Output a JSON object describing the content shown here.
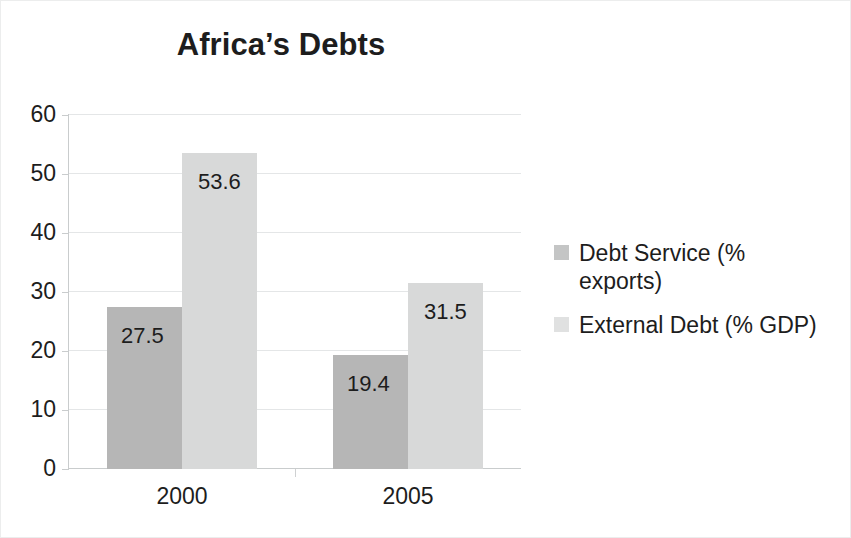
{
  "chart_data": {
    "type": "bar",
    "title": "Africa’s Debts",
    "xlabel": "",
    "ylabel": "",
    "categories": [
      "2000",
      "2005"
    ],
    "series": [
      {
        "name": "Debt Service (% exports)",
        "name_line1": "Debt Service (%",
        "name_line2": "exports)",
        "color": "#b6b6b6",
        "values": [
          27.5,
          19.4
        ],
        "labels": [
          "27.5",
          "19.4"
        ]
      },
      {
        "name": "External Debt (% GDP)",
        "name_line1": "External Debt (% GDP)",
        "name_line2": "",
        "color": "#d8d9d9",
        "values": [
          53.6,
          31.5
        ],
        "labels": [
          "53.6",
          "31.5"
        ]
      }
    ],
    "ylim": [
      0,
      60
    ],
    "yticks": [
      60,
      50,
      40,
      30,
      20,
      10,
      0
    ],
    "ytick_labels": [
      "60",
      "50",
      "40",
      "30",
      "20",
      "10",
      "0"
    ],
    "grid": true,
    "legend_position": "right",
    "data_labels": true
  }
}
